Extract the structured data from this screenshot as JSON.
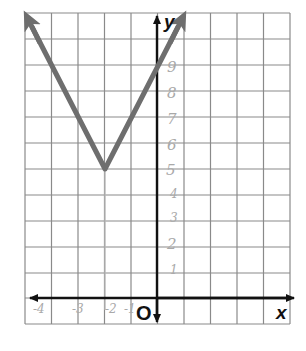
{
  "graph": {
    "equation_shown": "",
    "function": "y = 2|x + 2| + 5",
    "vertex": {
      "x": -2,
      "y": 5
    },
    "left_arm_end": {
      "x": -5,
      "y": 11
    },
    "right_arm_end": {
      "x": 1,
      "y": 11
    },
    "y_intercept": 9,
    "colors": {
      "graph_line": "#6e6e6e",
      "axes": "#111111",
      "grid": "#8a8a8a",
      "handwriting": "#a9a9a9"
    }
  },
  "axes": {
    "x_label": "x",
    "y_label": "y",
    "origin_label": "O",
    "x_range": [
      -5,
      5
    ],
    "y_range": [
      -1,
      11
    ]
  },
  "handwritten_labels": {
    "y_ticks": [
      "9",
      "8",
      "7",
      "6",
      "5",
      "4",
      "3",
      "2",
      "1"
    ],
    "x_ticks": [
      "-4",
      "-3",
      "-2",
      "-1"
    ]
  }
}
